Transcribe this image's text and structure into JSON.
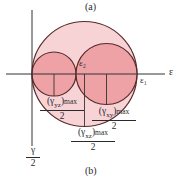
{
  "figure": {
    "caption_top": "(a)",
    "caption_bottom": "(b)",
    "colors": {
      "outer_circle_fill": "#f7d3d6",
      "inner_circle_fill": "#eea2a6",
      "stroke": "#5a2a2a",
      "axis": "#333333"
    },
    "axes": {
      "horizontal_label": "ε",
      "vertical_label_num": "γ",
      "vertical_label_den": "2"
    },
    "points": {
      "epsilon_1": "ε₁",
      "epsilon_2": "ε₂"
    },
    "radii_labels": {
      "yz": {
        "sym": "(γ",
        "sub": "yz",
        "close": ")",
        "max": "max",
        "den": "2"
      },
      "xy": {
        "sym": "(γ",
        "sub": "xy",
        "close": ")",
        "max": "max",
        "den": "2"
      },
      "xz": {
        "sym": "(γ",
        "sub": "xz",
        "close": ")",
        "max": "max",
        "den": "2"
      }
    }
  }
}
